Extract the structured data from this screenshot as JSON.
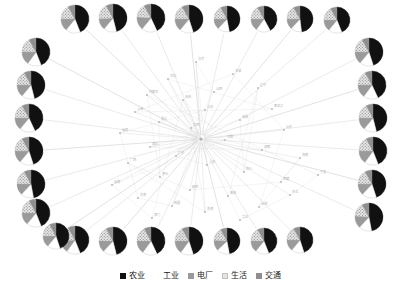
{
  "chart_data": {
    "type": "pie",
    "title": "",
    "subtitle": "",
    "xlabel": "",
    "ylabel": "",
    "layout": "radial-network-with-perimeter-pies",
    "grid": false,
    "legend_position": "bottom-center",
    "categories": [
      "农业",
      "工业",
      "电厂",
      "生活",
      "交通"
    ],
    "category_colors": [
      "#111111",
      "#ffffff",
      "#9a9a9a",
      "#c9c9c9",
      "#8f8f8f"
    ],
    "category_patterns": [
      "solid",
      "solid",
      "solid",
      "dotted-hatch",
      "solid"
    ],
    "pie_count": 28,
    "series": [
      {
        "name": "pie-top-1",
        "values": [
          44,
          17,
          14,
          17,
          8
        ]
      },
      {
        "name": "pie-top-2",
        "values": [
          46,
          15,
          13,
          18,
          8
        ]
      },
      {
        "name": "pie-top-3",
        "values": [
          43,
          18,
          15,
          16,
          8
        ]
      },
      {
        "name": "pie-top-4",
        "values": [
          45,
          16,
          14,
          17,
          8
        ]
      },
      {
        "name": "pie-top-5",
        "values": [
          47,
          15,
          13,
          17,
          8
        ]
      },
      {
        "name": "pie-top-6",
        "values": [
          42,
          18,
          15,
          17,
          8
        ]
      },
      {
        "name": "pie-top-7",
        "values": [
          48,
          14,
          13,
          17,
          8
        ]
      },
      {
        "name": "pie-top-8",
        "values": [
          44,
          17,
          14,
          17,
          8
        ]
      },
      {
        "name": "pie-right-1",
        "values": [
          45,
          16,
          14,
          17,
          8
        ]
      },
      {
        "name": "pie-right-2",
        "values": [
          43,
          17,
          15,
          17,
          8
        ]
      },
      {
        "name": "pie-right-3",
        "values": [
          46,
          15,
          14,
          17,
          8
        ]
      },
      {
        "name": "pie-right-4",
        "values": [
          44,
          16,
          15,
          17,
          8
        ]
      },
      {
        "name": "pie-right-5",
        "values": [
          45,
          17,
          13,
          17,
          8
        ]
      },
      {
        "name": "pie-right-6",
        "values": [
          47,
          15,
          14,
          16,
          8
        ]
      },
      {
        "name": "pie-bottom-1",
        "values": [
          44,
          16,
          14,
          18,
          8
        ]
      },
      {
        "name": "pie-bottom-2",
        "values": [
          46,
          16,
          13,
          17,
          8
        ]
      },
      {
        "name": "pie-bottom-3",
        "values": [
          43,
          17,
          15,
          17,
          8
        ]
      },
      {
        "name": "pie-bottom-4",
        "values": [
          45,
          15,
          15,
          17,
          8
        ]
      },
      {
        "name": "pie-bottom-5",
        "values": [
          47,
          16,
          13,
          16,
          8
        ]
      },
      {
        "name": "pie-bottom-6",
        "values": [
          44,
          17,
          14,
          17,
          8
        ]
      },
      {
        "name": "pie-bottom-7",
        "values": [
          45,
          16,
          14,
          17,
          8
        ]
      },
      {
        "name": "pie-left-1",
        "values": [
          44,
          16,
          15,
          17,
          8
        ]
      },
      {
        "name": "pie-left-2",
        "values": [
          46,
          15,
          14,
          17,
          8
        ]
      },
      {
        "name": "pie-left-3",
        "values": [
          43,
          18,
          14,
          17,
          8
        ]
      },
      {
        "name": "pie-left-4",
        "values": [
          45,
          16,
          14,
          17,
          8
        ]
      },
      {
        "name": "pie-left-5",
        "values": [
          47,
          15,
          13,
          17,
          8
        ]
      },
      {
        "name": "pie-left-6",
        "values": [
          44,
          17,
          14,
          17,
          8
        ]
      },
      {
        "name": "pie-left-7",
        "values": [
          45,
          16,
          14,
          17,
          8
        ]
      }
    ],
    "pie_positions": [
      {
        "name": "pie-top-1",
        "cx": 75,
        "cy": 19,
        "r": 14
      },
      {
        "name": "pie-top-2",
        "cx": 113,
        "cy": 18,
        "r": 14
      },
      {
        "name": "pie-top-3",
        "cx": 151,
        "cy": 18,
        "r": 14
      },
      {
        "name": "pie-top-4",
        "cx": 189,
        "cy": 19,
        "r": 14
      },
      {
        "name": "pie-top-5",
        "cx": 227,
        "cy": 19,
        "r": 13
      },
      {
        "name": "pie-top-6",
        "cx": 264,
        "cy": 19,
        "r": 13
      },
      {
        "name": "pie-top-7",
        "cx": 300,
        "cy": 19,
        "r": 13
      },
      {
        "name": "pie-top-8",
        "cx": 337,
        "cy": 20,
        "r": 13
      },
      {
        "name": "pie-right-1",
        "cx": 369,
        "cy": 52,
        "r": 14
      },
      {
        "name": "pie-right-2",
        "cx": 372,
        "cy": 85,
        "r": 14
      },
      {
        "name": "pie-right-3",
        "cx": 373,
        "cy": 118,
        "r": 14
      },
      {
        "name": "pie-right-4",
        "cx": 373,
        "cy": 151,
        "r": 14
      },
      {
        "name": "pie-right-5",
        "cx": 372,
        "cy": 184,
        "r": 14
      },
      {
        "name": "pie-right-6",
        "cx": 369,
        "cy": 217,
        "r": 14
      },
      {
        "name": "pie-bottom-1",
        "cx": 75,
        "cy": 240,
        "r": 14
      },
      {
        "name": "pie-bottom-2",
        "cx": 113,
        "cy": 241,
        "r": 14
      },
      {
        "name": "pie-bottom-3",
        "cx": 151,
        "cy": 241,
        "r": 14
      },
      {
        "name": "pie-bottom-4",
        "cx": 189,
        "cy": 241,
        "r": 14
      },
      {
        "name": "pie-bottom-5",
        "cx": 227,
        "cy": 241,
        "r": 13
      },
      {
        "name": "pie-bottom-6",
        "cx": 264,
        "cy": 241,
        "r": 13
      },
      {
        "name": "pie-bottom-7",
        "cx": 300,
        "cy": 240,
        "r": 13
      },
      {
        "name": "pie-left-1",
        "cx": 36,
        "cy": 52,
        "r": 14
      },
      {
        "name": "pie-left-2",
        "cx": 31,
        "cy": 85,
        "r": 14
      },
      {
        "name": "pie-left-3",
        "cx": 29,
        "cy": 118,
        "r": 14
      },
      {
        "name": "pie-left-4",
        "cx": 29,
        "cy": 151,
        "r": 14
      },
      {
        "name": "pie-left-5",
        "cx": 31,
        "cy": 184,
        "r": 14
      },
      {
        "name": "pie-left-6",
        "cx": 36,
        "cy": 213,
        "r": 14
      },
      {
        "name": "pie-left-7",
        "cx": 56,
        "cy": 236,
        "r": 13
      }
    ],
    "network": {
      "hub": {
        "x": 201,
        "y": 139
      },
      "edge_color": "#d5d5d5",
      "node_color": "#b8b8b8",
      "node_label_color": "#b0b0b0",
      "nodes": [
        {
          "x": 196,
          "y": 62
        },
        {
          "x": 233,
          "y": 74
        },
        {
          "x": 168,
          "y": 79
        },
        {
          "x": 214,
          "y": 92
        },
        {
          "x": 147,
          "y": 95
        },
        {
          "x": 258,
          "y": 88
        },
        {
          "x": 183,
          "y": 100
        },
        {
          "x": 272,
          "y": 109
        },
        {
          "x": 135,
          "y": 112
        },
        {
          "x": 205,
          "y": 110
        },
        {
          "x": 159,
          "y": 122
        },
        {
          "x": 240,
          "y": 120
        },
        {
          "x": 120,
          "y": 133
        },
        {
          "x": 191,
          "y": 128
        },
        {
          "x": 284,
          "y": 130
        },
        {
          "x": 225,
          "y": 140
        },
        {
          "x": 150,
          "y": 147
        },
        {
          "x": 262,
          "y": 150
        },
        {
          "x": 176,
          "y": 156
        },
        {
          "x": 128,
          "y": 163
        },
        {
          "x": 300,
          "y": 158
        },
        {
          "x": 207,
          "y": 165
        },
        {
          "x": 244,
          "y": 172
        },
        {
          "x": 160,
          "y": 177
        },
        {
          "x": 112,
          "y": 185
        },
        {
          "x": 281,
          "y": 182
        },
        {
          "x": 190,
          "y": 190
        },
        {
          "x": 138,
          "y": 198
        },
        {
          "x": 228,
          "y": 196
        },
        {
          "x": 318,
          "y": 175
        },
        {
          "x": 172,
          "y": 206
        },
        {
          "x": 259,
          "y": 207
        },
        {
          "x": 205,
          "y": 212
        },
        {
          "x": 152,
          "y": 218
        },
        {
          "x": 290,
          "y": 195
        },
        {
          "x": 240,
          "y": 220
        }
      ],
      "node_labels": [
        "北京",
        "天津",
        "河北",
        "山西",
        "内蒙古",
        "辽宁",
        "吉林",
        "黑龙江",
        "上海",
        "江苏",
        "浙江",
        "安徽",
        "福建",
        "江西",
        "山东",
        "河南",
        "湖北",
        "湖南",
        "广东",
        "广西",
        "海南",
        "重庆",
        "四川",
        "贵州",
        "云南",
        "西藏",
        "陕西",
        "甘肃",
        "青海",
        "宁夏",
        "新疆",
        "台湾",
        "香港",
        "澳门",
        "东北",
        "华北"
      ]
    }
  },
  "legend": {
    "items": [
      {
        "label": "农业",
        "swatch": "legend-swatch-agriculture"
      },
      {
        "label": "工业",
        "swatch": "legend-swatch-industry"
      },
      {
        "label": "电厂",
        "swatch": "legend-swatch-powerplant"
      },
      {
        "label": "生活",
        "swatch": "legend-swatch-domestic"
      },
      {
        "label": "交通",
        "swatch": "legend-swatch-transport"
      }
    ]
  }
}
